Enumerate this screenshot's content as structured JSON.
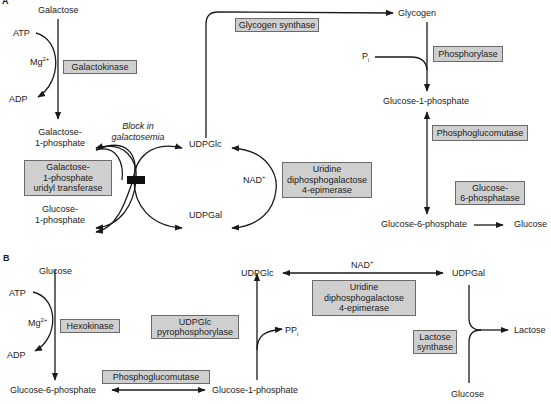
{
  "panels": {
    "a": {
      "label": "A",
      "metabolites": {
        "galactose": "Galactose",
        "atp": "ATP",
        "mg": "Mg",
        "mg_sup": "2+",
        "adp": "ADP",
        "galactose_1p_l1": "Galactose-",
        "galactose_1p_l2": "1-phosphate",
        "glucose_1p_l1": "Glucose-",
        "glucose_1p_l2": "1-phosphate",
        "udpglc": "UDPGlc",
        "udpgal": "UDPGal",
        "nad": "NAD",
        "nad_sup": "+",
        "glycogen": "Glycogen",
        "pi": "P",
        "pi_sub": "i",
        "glucose_1_phosphate": "Glucose-1-phosphate",
        "glucose_6_phosphate": "Glucose-6-phosphate",
        "glucose": "Glucose"
      },
      "annotation": {
        "block_l1": "Block in",
        "block_l2": "galactosemia"
      },
      "enzymes": {
        "galactokinase": "Galactokinase",
        "transferase_l1": "Galactose-",
        "transferase_l2": "1-phosphate",
        "transferase_l3": "uridyl transferase",
        "epimerase_l1": "Uridine",
        "epimerase_l2": "diphosphogalactose",
        "epimerase_l3": "4-epimerase",
        "glycogen_synthase": "Glycogen synthase",
        "phosphorylase": "Phosphorylase",
        "phosphoglucomutase": "Phosphoglucomutase",
        "g6pase_l1": "Glucose-",
        "g6pase_l2": "6-phosphatase"
      }
    },
    "b": {
      "label": "B",
      "metabolites": {
        "glucose_top": "Glucose",
        "atp": "ATP",
        "mg": "Mg",
        "mg_sup": "2+",
        "adp": "ADP",
        "glucose_6_phosphate": "Glucose-6-phosphate",
        "glucose_1_phosphate": "Glucose-1-phosphate",
        "udpglc": "UDPGlc",
        "ppi": "PP",
        "ppi_sub": "i",
        "nad": "NAD",
        "nad_sup": "+",
        "udpgal": "UDPGal",
        "lactose": "Lactose",
        "glucose_bottom": "Glucose"
      },
      "enzymes": {
        "hexokinase": "Hexokinase",
        "udpglc_ppase_l1": "UDPGlc",
        "udpglc_ppase_l2": "pyrophosphorylase",
        "phosphoglucomutase": "Phosphoglucomutase",
        "epimerase_l1": "Uridine",
        "epimerase_l2": "diphosphogalactose",
        "epimerase_l3": "4-epimerase",
        "lactose_synthase_l1": "Lactose",
        "lactose_synthase_l2": "synthase"
      }
    }
  },
  "colors": {
    "enzyme_box_fill": "#cfcfcf",
    "enzyme_box_border": "#6a6a6a",
    "arrow": "#1a1a1a",
    "block": "#111111"
  }
}
